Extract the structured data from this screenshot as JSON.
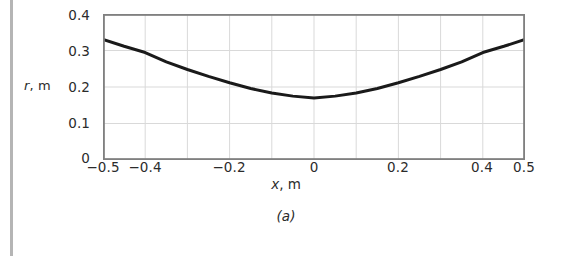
{
  "figure": {
    "caption": "(a)"
  },
  "chart_data": {
    "type": "line",
    "title": "",
    "subtitle": "",
    "xlabel": "x, m",
    "xlabel_symbol": "x",
    "xlabel_unit": ", m",
    "ylabel": "r, m",
    "ylabel_symbol": "r",
    "ylabel_unit": ", m",
    "xlim": [
      -0.5,
      0.5
    ],
    "ylim": [
      0.0,
      0.4
    ],
    "xticks": [
      -0.5,
      -0.4,
      -0.2,
      0,
      0.2,
      0.4,
      0.5
    ],
    "xtick_labels": [
      "−0.5",
      "−0.4",
      "−0.2",
      "0",
      "0.2",
      "0.4",
      "0.5"
    ],
    "yticks": [
      0,
      0.1,
      0.2,
      0.3,
      0.4
    ],
    "ytick_labels": [
      "0",
      "0.1",
      "0.2",
      "0.3",
      "0.4"
    ],
    "grid": true,
    "grid_x_step": 0.1,
    "grid_y_step": 0.1,
    "legend": null,
    "legend_position": "none",
    "series": [
      {
        "name": "r(x)",
        "color": "#1a1a1a",
        "line_width": 3,
        "x": [
          -0.5,
          -0.45,
          -0.4,
          -0.35,
          -0.3,
          -0.25,
          -0.2,
          -0.15,
          -0.1,
          -0.05,
          0.0,
          0.05,
          0.1,
          0.15,
          0.2,
          0.25,
          0.3,
          0.35,
          0.4,
          0.45,
          0.5
        ],
        "y": [
          0.33,
          0.3115,
          0.2945,
          0.269,
          0.248,
          0.229,
          0.2115,
          0.196,
          0.1835,
          0.175,
          0.17,
          0.175,
          0.1835,
          0.196,
          0.2115,
          0.229,
          0.248,
          0.269,
          0.2945,
          0.3115,
          0.33
        ]
      }
    ]
  },
  "colors": {
    "curve": "#1a1a1a",
    "frame": "#808080",
    "grid": "#d9d9d9",
    "text": "#2b2b2b",
    "page_edge": "#b5b5b5",
    "background": "#ffffff"
  }
}
